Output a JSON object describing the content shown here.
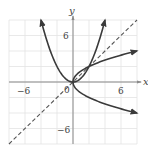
{
  "chart_data": {
    "type": "line",
    "title": "",
    "xlabel": "x",
    "ylabel": "y",
    "xlim": [
      -8,
      8
    ],
    "ylim": [
      -8,
      8
    ],
    "grid": true,
    "grid_step": 2,
    "x_ticks_labeled": [
      -6,
      0,
      6
    ],
    "y_ticks_labeled": [
      6,
      -6
    ],
    "legend": null,
    "series": [
      {
        "name": "f(x) = x^2/2",
        "style": "solid",
        "arrows": "both ends",
        "x": [
          -4,
          -3,
          -2,
          -1,
          0,
          1,
          2,
          3,
          4
        ],
        "y": [
          8,
          4.5,
          2,
          0.5,
          0,
          0.5,
          2,
          4.5,
          8
        ]
      },
      {
        "name": "inverse relation x = y^2/2 (y = ±sqrt(2x))",
        "style": "solid",
        "arrows": "both ends",
        "x": [
          8,
          4.5,
          2,
          0.5,
          0,
          0.5,
          2,
          4.5,
          8
        ],
        "y": [
          4,
          3,
          2,
          1,
          0,
          -1,
          -2,
          -3,
          -4
        ]
      },
      {
        "name": "y = x",
        "style": "dashed",
        "x": [
          -8,
          8
        ],
        "y": [
          -8,
          8
        ]
      }
    ]
  },
  "labels": {
    "x_axis": "x",
    "y_axis": "y",
    "origin": "0",
    "x_neg6": "−6",
    "x_pos6": "6",
    "y_pos6": "6",
    "y_neg6": "−6"
  },
  "colors": {
    "curve": "#3a3a3a",
    "grid": "#e3e3e3",
    "axis": "#8a8a8a"
  }
}
